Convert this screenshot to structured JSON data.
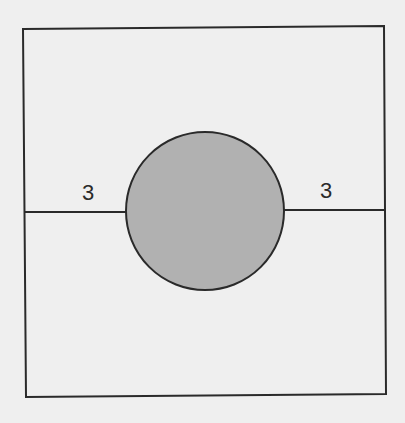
{
  "diagram": {
    "square": {
      "corners": {
        "top_left": [
          23,
          29
        ],
        "top_right": [
          384,
          26
        ],
        "bottom_right": [
          386,
          394
        ],
        "bottom_left": [
          26,
          397
        ]
      },
      "stroke": "#2a2a2a",
      "fill": "none"
    },
    "circle": {
      "cx": 205,
      "cy": 211,
      "r": 79,
      "fill": "#b1b1b1",
      "stroke": "#2a2a2a"
    },
    "segments": [
      {
        "name": "left-segment",
        "x1": 25,
        "y1": 212,
        "x2": 126,
        "y2": 212
      },
      {
        "name": "right-segment",
        "x1": 284,
        "y1": 210,
        "x2": 385,
        "y2": 210
      }
    ],
    "labels": [
      {
        "name": "left-length-label",
        "text": "3",
        "x": 88,
        "y": 200
      },
      {
        "name": "right-length-label",
        "text": "3",
        "x": 326,
        "y": 198
      }
    ],
    "colors": {
      "background": "#efefef",
      "line": "#2a2a2a",
      "circle_fill": "#b1b1b1"
    }
  }
}
